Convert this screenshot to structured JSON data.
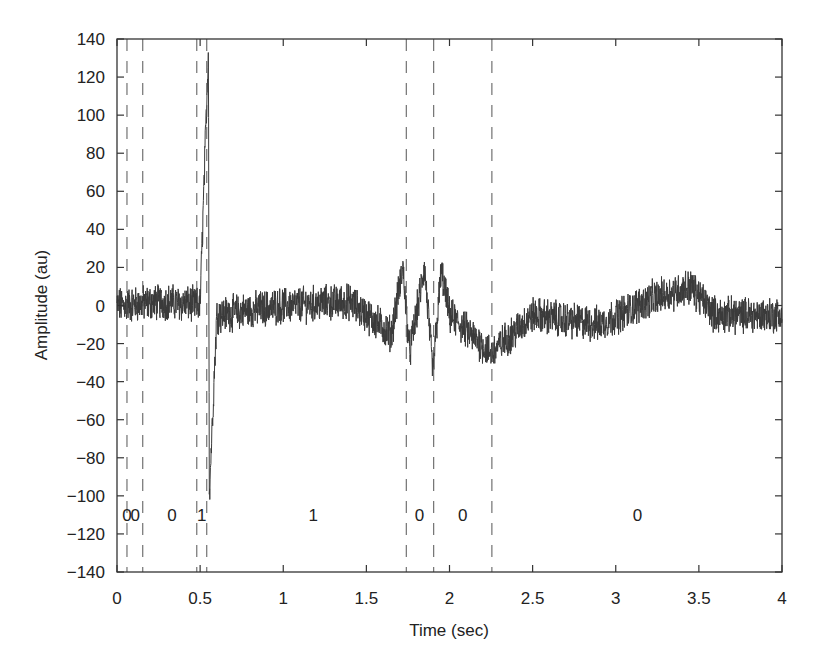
{
  "chart_data": {
    "type": "line",
    "title": "",
    "xlabel": "Time (sec)",
    "ylabel": "Amplitude (au)",
    "xlim": [
      0,
      4
    ],
    "ylim": [
      -140,
      140
    ],
    "xticks": [
      0,
      0.5,
      1,
      1.5,
      2,
      2.5,
      3,
      3.5,
      4
    ],
    "xtick_labels": [
      "0",
      "0.5",
      "1",
      "1.5",
      "2",
      "2.5",
      "3",
      "3.5",
      "4"
    ],
    "yticks": [
      140,
      120,
      100,
      80,
      60,
      40,
      20,
      0,
      -20,
      -40,
      -60,
      -80,
      -100,
      -120,
      -140
    ],
    "ytick_labels": [
      "140",
      "120",
      "100",
      "80",
      "60",
      "40",
      "20",
      "0",
      "−20",
      "−40",
      "−60",
      "−80",
      "−100",
      "−120",
      "−140"
    ],
    "grid": false,
    "legend": null,
    "segment_boundaries_sec": [
      0.06,
      0.155,
      0.48,
      0.54,
      1.74,
      1.905,
      2.255
    ],
    "segment_labels": [
      {
        "x": 0.06,
        "text": "0"
      },
      {
        "x": 0.11,
        "text": "0"
      },
      {
        "x": 0.33,
        "text": "0"
      },
      {
        "x": 0.51,
        "text": "1"
      },
      {
        "x": 1.18,
        "text": "1"
      },
      {
        "x": 1.82,
        "text": "0"
      },
      {
        "x": 2.08,
        "text": "0"
      },
      {
        "x": 3.13,
        "text": "0"
      }
    ],
    "segment_label_y": -110,
    "series": [
      {
        "name": "signal",
        "color": "#3a3a3a",
        "description": "Noisy waveform around 0 (±10 au); sharp spike near t=0.55 s reaching ~+135 and ~-100; oscillatory burst between 1.6 and 2.0 s (±20 to -35); broad low hump around 3.1-3.6 s (~+10).",
        "key_points": [
          {
            "x": 0.0,
            "y": 0
          },
          {
            "x": 0.3,
            "y": 2
          },
          {
            "x": 0.5,
            "y": 0
          },
          {
            "x": 0.55,
            "y": 135
          },
          {
            "x": 0.555,
            "y": -100
          },
          {
            "x": 0.6,
            "y": -5
          },
          {
            "x": 1.0,
            "y": 0
          },
          {
            "x": 1.4,
            "y": 2
          },
          {
            "x": 1.65,
            "y": -15
          },
          {
            "x": 1.72,
            "y": 20
          },
          {
            "x": 1.76,
            "y": -25
          },
          {
            "x": 1.85,
            "y": 20
          },
          {
            "x": 1.9,
            "y": -35
          },
          {
            "x": 1.95,
            "y": 18
          },
          {
            "x": 2.0,
            "y": -5
          },
          {
            "x": 2.25,
            "y": -25
          },
          {
            "x": 2.5,
            "y": -5
          },
          {
            "x": 2.9,
            "y": -10
          },
          {
            "x": 3.2,
            "y": 3
          },
          {
            "x": 3.45,
            "y": 10
          },
          {
            "x": 3.6,
            "y": -5
          },
          {
            "x": 4.0,
            "y": -5
          }
        ]
      }
    ]
  }
}
